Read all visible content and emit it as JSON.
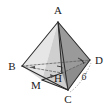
{
  "figure": {
    "type": "geometry-diagram",
    "background": "#ffffff",
    "labels": {
      "apex": "A",
      "left": "B",
      "right": "D",
      "bottom": "C",
      "foot": "H",
      "midpoint": "M",
      "edge_length_cd": "6"
    },
    "colors": {
      "stroke": "#2b2b2b",
      "dashed": "#6b6b6b",
      "face_abm_light": "#e2e2e2",
      "face_abd_mid": "#c9c9c9",
      "face_acd_dark": "#9e9e9e",
      "face_hcd_darker": "#8a8a8a",
      "face_bmc_light": "#d8d8d8",
      "label_color": "#1a1a1a"
    },
    "vertices": {
      "A": [
        58,
        22
      ],
      "B": [
        22,
        66
      ],
      "C": [
        68,
        90
      ],
      "D": [
        90,
        60
      ],
      "H": [
        62,
        73
      ],
      "M": [
        42,
        80
      ]
    },
    "marks": {
      "right_angle_at": "H",
      "angle_arc_at": "D"
    },
    "edges": [
      {
        "name": "AB",
        "style": "solid"
      },
      {
        "name": "AC",
        "style": "solid"
      },
      {
        "name": "AD",
        "style": "solid"
      },
      {
        "name": "BC",
        "style": "solid"
      },
      {
        "name": "CD",
        "style": "solid"
      },
      {
        "name": "BD",
        "style": "dashed"
      },
      {
        "name": "AH",
        "style": "solid"
      },
      {
        "name": "HD",
        "style": "dashed"
      },
      {
        "name": "BH",
        "style": "dashed"
      },
      {
        "name": "MH",
        "style": "solid"
      },
      {
        "name": "MC",
        "style": "solid"
      }
    ]
  }
}
